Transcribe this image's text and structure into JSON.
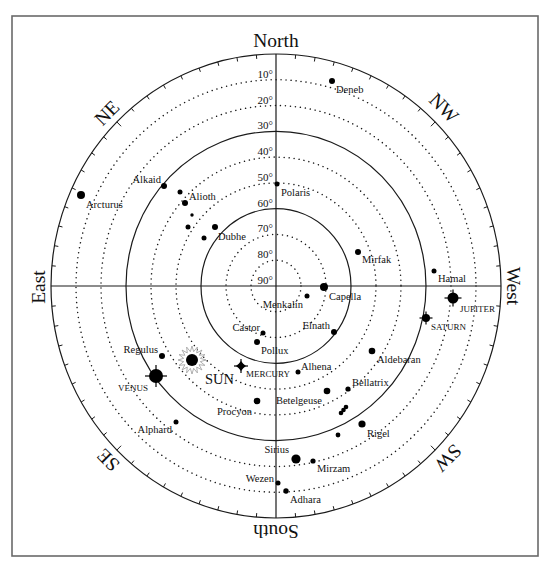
{
  "frame": {
    "x": 12,
    "y": 16,
    "w": 526,
    "h": 540
  },
  "horizon": {
    "cx": 276,
    "cy": 286,
    "rx": 225,
    "ry": 232
  },
  "colors": {
    "ink": "#1a1a1a",
    "frame": "#6a6a6a",
    "sun_rays": "#9a9a9a",
    "background": "#ffffff"
  },
  "ticks": {
    "step_deg": 5,
    "length": 4,
    "major_length": 6
  },
  "compass": [
    {
      "key": "north",
      "label": "North",
      "x": 276,
      "y": 40,
      "rotate": 0
    },
    {
      "key": "south",
      "label": "South",
      "x": 276,
      "y": 531,
      "rotate": 180
    },
    {
      "key": "east",
      "label": "East",
      "x": 38,
      "y": 287,
      "rotate": -90
    },
    {
      "key": "west",
      "label": "West",
      "x": 513,
      "y": 286,
      "rotate": 90
    },
    {
      "key": "ne",
      "label": "NE",
      "x": 107,
      "y": 113,
      "rotate": -45
    },
    {
      "key": "nw",
      "label": "NW",
      "x": 444,
      "y": 108,
      "rotate": 45
    },
    {
      "key": "se",
      "label": "SE",
      "x": 108,
      "y": 460,
      "rotate": -135
    },
    {
      "key": "sw",
      "label": "SW",
      "x": 448,
      "y": 458,
      "rotate": 135
    }
  ],
  "altitude_rings": [
    {
      "alt": 0,
      "style": "solid"
    },
    {
      "alt": 10,
      "style": "dotted"
    },
    {
      "alt": 20,
      "style": "dotted"
    },
    {
      "alt": 30,
      "style": "solid"
    },
    {
      "alt": 40,
      "style": "dotted"
    },
    {
      "alt": 50,
      "style": "dotted"
    },
    {
      "alt": 60,
      "style": "solid"
    },
    {
      "alt": 70,
      "style": "dotted"
    },
    {
      "alt": 80,
      "style": "dotted"
    }
  ],
  "altitude_labels": [
    {
      "alt": 10,
      "label": "10°"
    },
    {
      "alt": 20,
      "label": "20°"
    },
    {
      "alt": 30,
      "label": "30°"
    },
    {
      "alt": 40,
      "label": "40°"
    },
    {
      "alt": 50,
      "label": "50°"
    },
    {
      "alt": 60,
      "label": "60°"
    },
    {
      "alt": 70,
      "label": "70°"
    },
    {
      "alt": 80,
      "label": "80°"
    },
    {
      "alt": 90,
      "label": "90°"
    }
  ],
  "stars": [
    {
      "label": "Deneb",
      "x": 332,
      "y": 81,
      "r": 3,
      "lx": 336,
      "ly": 93,
      "anchor": "start"
    },
    {
      "label": "Polaris",
      "x": 277,
      "y": 184,
      "r": 2.5,
      "lx": 281,
      "ly": 196,
      "anchor": "start"
    },
    {
      "label": "Arcturus",
      "x": 81,
      "y": 195,
      "r": 4,
      "lx": 86,
      "ly": 208,
      "anchor": "start"
    },
    {
      "label": "Alkaid",
      "x": 164,
      "y": 186,
      "r": 3,
      "lx": 161,
      "ly": 183,
      "anchor": "end"
    },
    {
      "label": "",
      "x": 180,
      "y": 192,
      "r": 2.5
    },
    {
      "label": "Alioth",
      "x": 185,
      "y": 203,
      "r": 3,
      "lx": 189,
      "ly": 200,
      "anchor": "start"
    },
    {
      "label": "",
      "x": 192,
      "y": 215,
      "r": 1.7
    },
    {
      "label": "",
      "x": 188,
      "y": 227,
      "r": 2.5
    },
    {
      "label": "Dubhe",
      "x": 215,
      "y": 227,
      "r": 3,
      "lx": 218,
      "ly": 240,
      "anchor": "start"
    },
    {
      "label": "",
      "x": 204,
      "y": 238,
      "r": 2.5
    },
    {
      "label": "Mirfak",
      "x": 358,
      "y": 252,
      "r": 3,
      "lx": 362,
      "ly": 263,
      "anchor": "start"
    },
    {
      "label": "Hamal",
      "x": 434,
      "y": 271,
      "r": 2.5,
      "lx": 438,
      "ly": 282,
      "anchor": "start"
    },
    {
      "label": "Capella",
      "x": 324,
      "y": 287,
      "r": 4,
      "lx": 329,
      "ly": 300,
      "anchor": "start"
    },
    {
      "label": "Menkalin",
      "x": 307,
      "y": 296,
      "r": 2.5,
      "lx": 303,
      "ly": 308,
      "anchor": "end"
    },
    {
      "label": "Elnath",
      "x": 334,
      "y": 332,
      "r": 3,
      "lx": 330,
      "ly": 329,
      "anchor": "end"
    },
    {
      "label": "Castor",
      "x": 263,
      "y": 333,
      "r": 2.5,
      "lx": 260,
      "ly": 331,
      "anchor": "end"
    },
    {
      "label": "Pollux",
      "x": 257,
      "y": 342,
      "r": 3,
      "lx": 261,
      "ly": 354,
      "anchor": "start"
    },
    {
      "label": "Alhena",
      "x": 298,
      "y": 372,
      "r": 2.5,
      "lx": 301,
      "ly": 370,
      "anchor": "start"
    },
    {
      "label": "Aldebaran",
      "x": 372,
      "y": 351,
      "r": 3.3,
      "lx": 377,
      "ly": 363,
      "anchor": "start"
    },
    {
      "label": "Bellatrix",
      "x": 348,
      "y": 389,
      "r": 2.6,
      "lx": 352,
      "ly": 386,
      "anchor": "start"
    },
    {
      "label": "Betelgeuse",
      "x": 327,
      "y": 391,
      "r": 3.3,
      "lx": 322,
      "ly": 404,
      "anchor": "end"
    },
    {
      "label": "",
      "x": 341,
      "y": 413,
      "r": 2.3
    },
    {
      "label": "",
      "x": 343.5,
      "y": 410,
      "r": 2.3
    },
    {
      "label": "",
      "x": 346,
      "y": 407,
      "r": 2.3
    },
    {
      "label": "Rigel",
      "x": 362,
      "y": 424,
      "r": 3.6,
      "lx": 367,
      "ly": 437,
      "anchor": "start"
    },
    {
      "label": "",
      "x": 338,
      "y": 435,
      "r": 2.4
    },
    {
      "label": "Procyon",
      "x": 257,
      "y": 401,
      "r": 3.3,
      "lx": 252,
      "ly": 415,
      "anchor": "end"
    },
    {
      "label": "Regulus",
      "x": 162,
      "y": 356,
      "r": 3,
      "lx": 158,
      "ly": 353,
      "anchor": "end"
    },
    {
      "label": "Alphard",
      "x": 176,
      "y": 422,
      "r": 2.5,
      "lx": 172,
      "ly": 433,
      "anchor": "end"
    },
    {
      "label": "Sirius",
      "x": 296,
      "y": 459,
      "r": 4.6,
      "lx": 289,
      "ly": 453,
      "anchor": "end"
    },
    {
      "label": "Mirzam",
      "x": 313,
      "y": 461,
      "r": 2.6,
      "lx": 317,
      "ly": 472,
      "anchor": "start"
    },
    {
      "label": "Wezen",
      "x": 278,
      "y": 483,
      "r": 2.5,
      "lx": 274,
      "ly": 482,
      "anchor": "end"
    },
    {
      "label": "Adhara",
      "x": 286,
      "y": 491,
      "r": 2.7,
      "lx": 290,
      "ly": 503,
      "anchor": "start"
    }
  ],
  "planets": [
    {
      "key": "jupiter",
      "label": "JUPITER",
      "symbol": "cross-disc",
      "x": 453,
      "y": 298,
      "r": 5.5,
      "arm": 8.5,
      "lx": 460,
      "ly": 312,
      "anchor": "start"
    },
    {
      "key": "saturn",
      "label": "SATURN",
      "symbol": "cross-disc",
      "x": 426,
      "y": 318,
      "r": 4,
      "arm": 6.5,
      "lx": 431,
      "ly": 330,
      "anchor": "start"
    },
    {
      "key": "venus",
      "label": "VENUS",
      "symbol": "cross-disc",
      "x": 156,
      "y": 376,
      "r": 7,
      "arm": 11,
      "lx": 148,
      "ly": 391,
      "anchor": "end"
    },
    {
      "key": "mercury",
      "label": "MERCURY",
      "symbol": "diamond",
      "x": 241,
      "y": 366,
      "r": 5,
      "arm": 7,
      "lx": 246,
      "ly": 377,
      "anchor": "start"
    }
  ],
  "sun": {
    "label": "SUN",
    "x": 192,
    "y": 360,
    "r": 6,
    "ray_points": 16,
    "ray_outer": 14,
    "ray_inner": 8.5,
    "lx": 205,
    "ly": 384,
    "anchor": "start"
  }
}
